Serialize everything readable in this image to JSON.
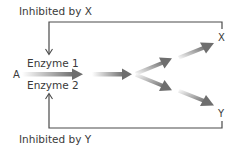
{
  "labels": {
    "inhibited_by_x": "Inhibited by X",
    "inhibited_by_y": "Inhibited by Y",
    "enzyme_1": "Enzyme 1",
    "enzyme_2": "Enzyme 2",
    "substrate_a": "A",
    "product_x": "X",
    "product_y": "Y"
  },
  "pathway": {
    "start": "A",
    "enzymes": [
      "Enzyme 1",
      "Enzyme 2"
    ],
    "branches": [
      {
        "product": "X",
        "inhibits": "Enzyme 1"
      },
      {
        "product": "Y",
        "inhibits": "Enzyme 2"
      }
    ]
  },
  "colors": {
    "text": "#3a3a3a",
    "line": "#4a4a4a",
    "arrow_dark": "#707070",
    "arrow_light": "#ffffff"
  }
}
